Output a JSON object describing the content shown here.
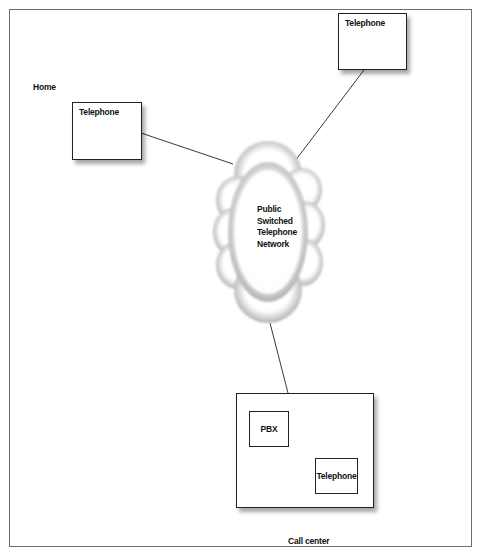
{
  "diagram": {
    "labels": {
      "home": "Home",
      "call_center": "Call center"
    },
    "nodes": {
      "home_telephone": "Telephone",
      "remote_telephone": "Telephone",
      "pstn": [
        "Public",
        "Switched",
        "Telephone",
        "Network"
      ],
      "pbx": "PBX",
      "call_center_telephone": "Telephone"
    },
    "edges": [
      {
        "from": "home_telephone",
        "to": "pstn"
      },
      {
        "from": "remote_telephone",
        "to": "pstn"
      },
      {
        "from": "pstn",
        "to": "call_center"
      },
      {
        "from": "pbx",
        "to": "call_center_telephone"
      }
    ],
    "colors": {
      "line": "#222222",
      "frame": "#6e6e6e",
      "cloud_edge": "#7a7a7a"
    }
  }
}
